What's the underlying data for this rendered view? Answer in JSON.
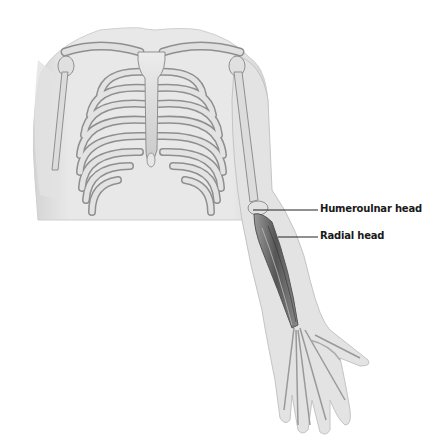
{
  "diagram": {
    "labels": [
      {
        "id": "humeroulnar",
        "text": "Humeroulnar head",
        "x": 320,
        "y": 203,
        "line": [
          253,
          210,
          318,
          210
        ]
      },
      {
        "id": "radial",
        "text": "Radial head",
        "x": 320,
        "y": 230,
        "line": [
          278,
          237,
          318,
          237
        ]
      }
    ],
    "colors": {
      "skin": "#e4e4e4",
      "skin_edge": "#c8c8c8",
      "bone": "#d9d9d9",
      "bone_edge": "#8f8f8f",
      "muscle": "#6a6a6a",
      "label": "#1a1a1a",
      "leader": "#222222"
    }
  }
}
